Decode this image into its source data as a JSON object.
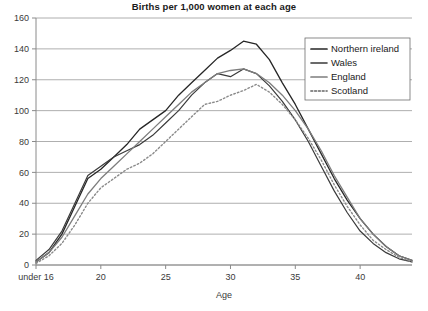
{
  "chart_data": {
    "type": "line",
    "title": "Births per 1,000 women at each age",
    "xlabel": "Age",
    "ylabel": "",
    "xlim": [
      15,
      44
    ],
    "ylim": [
      0,
      160
    ],
    "grid": true,
    "legend_position": "top-right",
    "x_tick_labels": [
      "under 16",
      "20",
      "25",
      "30",
      "35",
      "40"
    ],
    "x_tick_values": [
      15,
      20,
      25,
      30,
      35,
      40
    ],
    "y_tick_labels": [
      "0",
      "20",
      "40",
      "60",
      "80",
      "100",
      "120",
      "140",
      "160"
    ],
    "y_tick_values": [
      0,
      20,
      40,
      60,
      80,
      100,
      120,
      140,
      160
    ],
    "x": [
      15,
      16,
      17,
      18,
      19,
      20,
      21,
      22,
      23,
      24,
      25,
      26,
      27,
      28,
      29,
      30,
      31,
      32,
      33,
      34,
      35,
      36,
      37,
      38,
      39,
      40,
      41,
      42,
      43,
      44
    ],
    "series": [
      {
        "name": "Northern ireland",
        "style": "solid",
        "color": "#262626",
        "width": 1.3,
        "values": [
          2,
          8,
          20,
          38,
          56,
          62,
          70,
          78,
          88,
          94,
          100,
          110,
          118,
          126,
          134,
          139,
          145,
          143,
          133,
          118,
          104,
          88,
          72,
          56,
          42,
          30,
          20,
          12,
          6,
          3
        ]
      },
      {
        "name": "Wales",
        "style": "solid",
        "color": "#3a3a3a",
        "width": 1.2,
        "values": [
          3,
          10,
          22,
          40,
          58,
          64,
          70,
          74,
          78,
          84,
          92,
          100,
          110,
          118,
          124,
          122,
          127,
          124,
          116,
          106,
          94,
          80,
          64,
          48,
          34,
          22,
          14,
          8,
          4,
          2
        ]
      },
      {
        "name": "England",
        "style": "solid",
        "color": "#7d7d7d",
        "width": 1.3,
        "values": [
          2,
          8,
          18,
          32,
          46,
          56,
          64,
          72,
          80,
          88,
          96,
          104,
          112,
          118,
          124,
          126,
          127,
          124,
          118,
          110,
          100,
          88,
          74,
          58,
          44,
          30,
          20,
          12,
          6,
          3
        ]
      },
      {
        "name": "Scotland",
        "style": "dotted",
        "color": "#8a8a8a",
        "width": 1.4,
        "values": [
          1,
          6,
          14,
          26,
          40,
          50,
          56,
          62,
          66,
          72,
          80,
          88,
          96,
          104,
          106,
          110,
          113,
          117,
          112,
          104,
          94,
          82,
          68,
          52,
          38,
          26,
          16,
          10,
          5,
          2
        ]
      }
    ]
  },
  "legend": {
    "items": [
      {
        "label": "Northern ireland"
      },
      {
        "label": "Wales"
      },
      {
        "label": "England"
      },
      {
        "label": "Scotland"
      }
    ]
  }
}
